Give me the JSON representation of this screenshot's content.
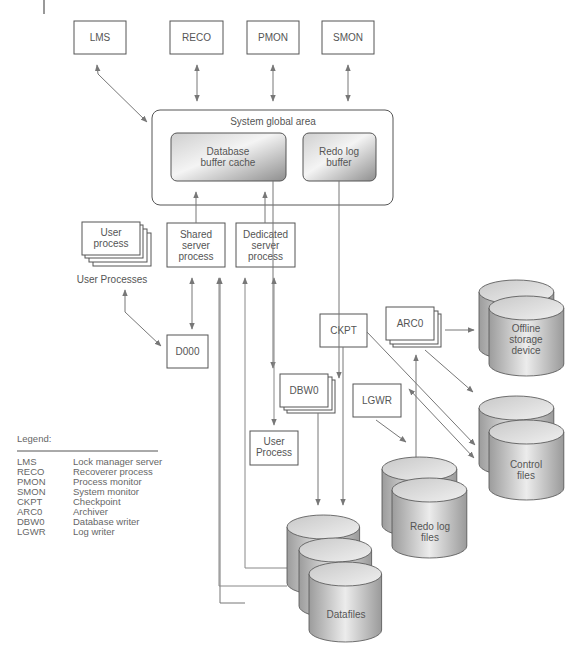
{
  "diagram": {
    "top_processes": [
      {
        "id": "lms",
        "label": "LMS"
      },
      {
        "id": "reco",
        "label": "RECO"
      },
      {
        "id": "pmon",
        "label": "PMON"
      },
      {
        "id": "smon",
        "label": "SMON"
      }
    ],
    "sga": {
      "title": "System global area",
      "buffer_cache": [
        "Database",
        "buffer cache"
      ],
      "redo_buffer": [
        "Redo log",
        "buffer"
      ]
    },
    "user_process": [
      "User",
      "process"
    ],
    "user_processes_caption": "User Processes",
    "shared_server": [
      "Shared",
      "server",
      "process"
    ],
    "dedicated_server": [
      "Dedicated",
      "server",
      "process"
    ],
    "d000": "D000",
    "ckpt": "CKPT",
    "arc0": "ARC0",
    "dbw0": "DBW0",
    "lgwr": "LGWR",
    "user_process_2": [
      "User",
      "Process"
    ],
    "offline_storage": [
      "Offline",
      "storage",
      "device"
    ],
    "control_files": [
      "Control",
      "files"
    ],
    "redo_log_files": [
      "Redo log",
      "files"
    ],
    "datafiles": "Datafiles",
    "legend": {
      "title": "Legend:",
      "entries": [
        {
          "abbr": "LMS",
          "desc": "Lock manager server"
        },
        {
          "abbr": "RECO",
          "desc": "Recoverer process"
        },
        {
          "abbr": "PMON",
          "desc": "Process monitor"
        },
        {
          "abbr": "SMON",
          "desc": "System monitor"
        },
        {
          "abbr": "CKPT",
          "desc": "Checkpoint"
        },
        {
          "abbr": "ARC0",
          "desc": "Archiver"
        },
        {
          "abbr": "DBW0",
          "desc": "Database writer"
        },
        {
          "abbr": "LGWR",
          "desc": "Log writer"
        }
      ]
    },
    "colors": {
      "stroke": "#555555",
      "arrow": "#777777",
      "cylinder_light": "#e4e4e4",
      "cylinder_dark": "#9a9a9a"
    }
  }
}
